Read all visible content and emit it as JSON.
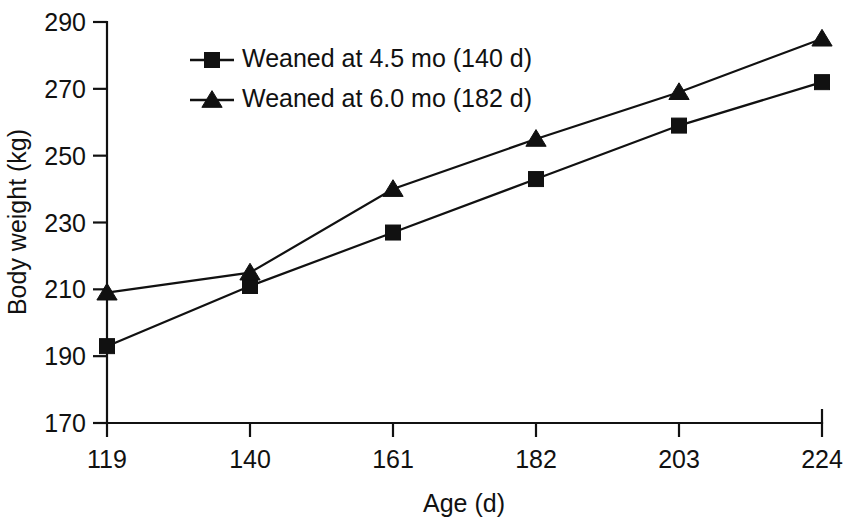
{
  "chart_data": {
    "type": "line",
    "title": "",
    "xlabel": "Age (d)",
    "ylabel": "Body weight (kg)",
    "x": [
      119,
      140,
      161,
      182,
      203,
      224
    ],
    "xticklabels": [
      "119",
      "140",
      "161",
      "182",
      "203",
      "224"
    ],
    "yticks": [
      170,
      190,
      210,
      230,
      250,
      270,
      290
    ],
    "yticklabels": [
      "170",
      "190",
      "210",
      "230",
      "250",
      "270",
      "290"
    ],
    "xlim": [
      119,
      224
    ],
    "ylim": [
      170,
      290
    ],
    "grid": false,
    "legend_position": "upper-left-inside",
    "series": [
      {
        "name": "Weaned at 4.5 mo (140 d)",
        "marker": "square",
        "color": "#111111",
        "values": [
          193,
          211,
          227,
          243,
          259,
          272
        ]
      },
      {
        "name": "Weaned at 6.0 mo (182 d)",
        "marker": "triangle",
        "color": "#111111",
        "values": [
          209,
          215,
          240,
          255,
          269,
          285
        ]
      }
    ]
  },
  "axes": {
    "y_axis_title": "Body weight (kg)",
    "x_axis_title": "Age (d)"
  },
  "legend": {
    "entries": [
      {
        "label": "Weaned at 4.5 mo (140 d)",
        "marker": "square-marker"
      },
      {
        "label": "Weaned at 6.0 mo (182 d)",
        "marker": "triangle-marker"
      }
    ]
  }
}
